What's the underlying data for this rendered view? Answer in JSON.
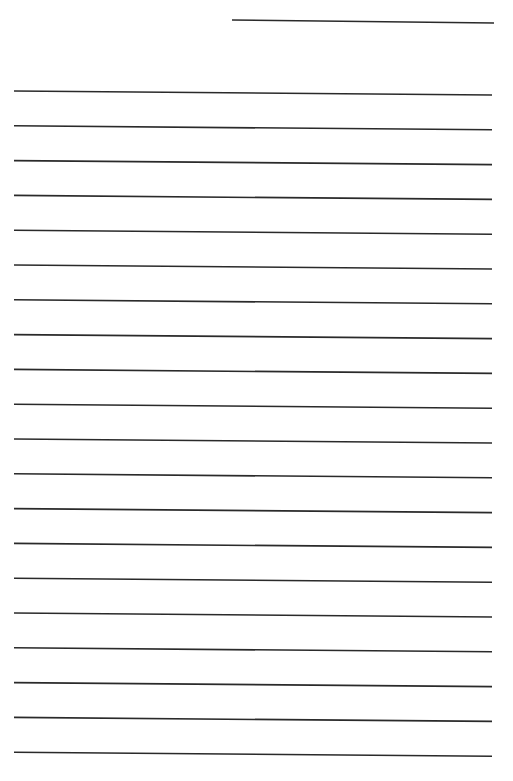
{
  "page": {
    "background": "#ffffff",
    "line_color": "#2a2a2a",
    "width": 513,
    "height": 781
  },
  "header_line": {
    "x1": 232,
    "y1": 20,
    "x2": 494,
    "y2": 23
  },
  "ruled_lines": {
    "count": 20,
    "x_start": 14,
    "x_end": 492,
    "first_y": 91,
    "spacing": 34.8,
    "right_drop": 4
  }
}
